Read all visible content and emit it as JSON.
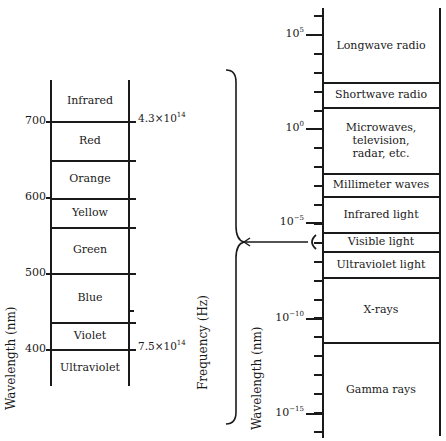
{
  "left_scale": {
    "axis_label": "Wavelength (nm)",
    "second_axis_label": "Frequency (Hz)",
    "ticks": [
      {
        "value": "700",
        "y": 121
      },
      {
        "value": "600",
        "y": 197
      },
      {
        "value": "500",
        "y": 273
      },
      {
        "value": "400",
        "y": 349
      }
    ],
    "frequency_marks": [
      {
        "base": "4.3×10",
        "exp": "14",
        "y": 121
      },
      {
        "base": "7.5×10",
        "exp": "14",
        "y": 349
      }
    ],
    "bands": [
      {
        "label": "Infrared",
        "top": 80,
        "bottom": 121
      },
      {
        "label": "Red",
        "top": 121,
        "bottom": 160
      },
      {
        "label": "Orange",
        "top": 160,
        "bottom": 198
      },
      {
        "label": "Yellow",
        "top": 198,
        "bottom": 227
      },
      {
        "label": "Green",
        "top": 227,
        "bottom": 273
      },
      {
        "label": "Blue",
        "top": 273,
        "bottom": 322
      },
      {
        "label": "Violet",
        "top": 322,
        "bottom": 349
      },
      {
        "label": "Ultraviolet",
        "top": 349,
        "bottom": 386
      }
    ]
  },
  "right_scale": {
    "axis_label": "Wavelength (nm)",
    "ticks": [
      {
        "base": "10",
        "exp": "5",
        "y": 34
      },
      {
        "base": "10",
        "exp": "0",
        "y": 128
      },
      {
        "base": "10",
        "exp": "−5",
        "y": 222
      },
      {
        "base": "10",
        "exp": "−10",
        "y": 318
      },
      {
        "base": "10",
        "exp": "−15",
        "y": 413
      }
    ],
    "bands": [
      {
        "label": "Longwave radio",
        "top": 8,
        "bottom": 82
      },
      {
        "label": "Shortwave radio",
        "top": 82,
        "bottom": 107
      },
      {
        "label": "Microwaves,\ntelevision,\nradar, etc.",
        "top": 107,
        "bottom": 173
      },
      {
        "label": "Millimeter waves",
        "top": 173,
        "bottom": 196
      },
      {
        "label": "Infrared light",
        "top": 196,
        "bottom": 232
      },
      {
        "label": "Visible light",
        "top": 232,
        "bottom": 251
      },
      {
        "label": "Ultraviolet light",
        "top": 251,
        "bottom": 277
      },
      {
        "label": "X-rays",
        "top": 277,
        "bottom": 342
      },
      {
        "label": "Gamma rays",
        "top": 342,
        "bottom": 436
      }
    ]
  }
}
